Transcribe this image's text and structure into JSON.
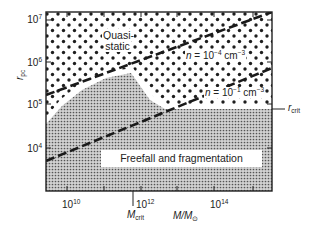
{
  "figure": {
    "type": "regime-diagram",
    "x_axis": {
      "label_main": "M/M",
      "label_sub": "⊙",
      "scale": "log",
      "ticks": [
        {
          "base": "10",
          "exp": "10"
        },
        {
          "base": "10",
          "exp": "12"
        },
        {
          "base": "10",
          "exp": "14"
        }
      ]
    },
    "y_axis": {
      "label_main": "r",
      "label_sub": "pc",
      "scale": "log",
      "ticks": [
        {
          "base": "10",
          "exp": "7"
        },
        {
          "base": "10",
          "exp": "6"
        },
        {
          "base": "10",
          "exp": "5"
        },
        {
          "base": "10",
          "exp": "4"
        }
      ]
    },
    "regions": {
      "upper": "Quasi-static",
      "lower": "Freefall and fragmentation"
    },
    "lines": [
      {
        "n_label": "n",
        "equals": " = 10",
        "exp": "−4",
        "unit": " cm",
        "unit_exp": "−3"
      },
      {
        "n_label": "n",
        "equals": " = 10",
        "exp": "−1",
        "unit": " cm",
        "unit_exp": "−3"
      }
    ],
    "markers": {
      "r_crit_main": "r",
      "r_crit_sub": "crit",
      "m_crit_main": "M",
      "m_crit_sub": "crit"
    },
    "colors": {
      "frame": "#222222",
      "dots": "#1e1e1e",
      "fine_stipple": "#6a6a6a",
      "background": "#ffffff"
    }
  }
}
